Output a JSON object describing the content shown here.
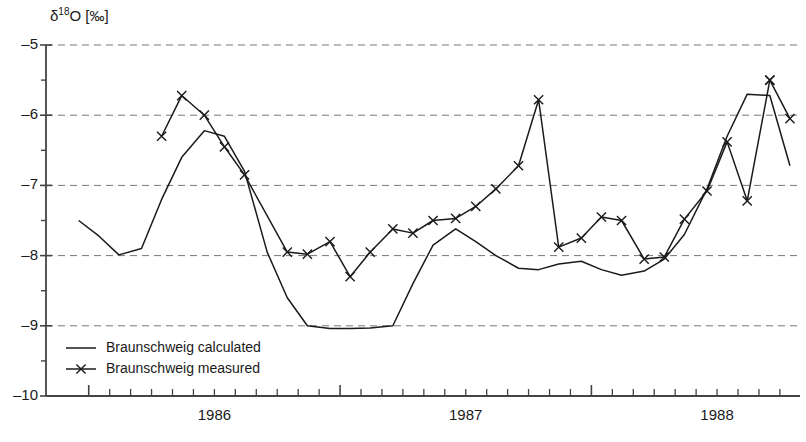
{
  "chart_data": {
    "type": "line",
    "title": "",
    "subtitle": "",
    "xlabel": "",
    "ylabel": "δ18O [‰]",
    "ylabel_parts": {
      "delta": "δ",
      "superscript": "18",
      "element": "O",
      "unit": "[‰]"
    },
    "ylim": [
      -10,
      -5
    ],
    "xlim": [
      1985.83,
      1988.83
    ],
    "ytick_labels": [
      "-5",
      "-6",
      "-7",
      "-8",
      "-9",
      "-10"
    ],
    "ytick_values": [
      -5,
      -6,
      -7,
      -8,
      -9,
      -10
    ],
    "yminor_values": [
      -5.5,
      -6.5,
      -7.5,
      -8.5,
      -9.5
    ],
    "xtick_labels": [
      "1986",
      "1987",
      "1988"
    ],
    "xtick_values": [
      1986.5,
      1987.5,
      1988.5
    ],
    "grid": "horizontal-dashed",
    "legend_position": "bottom-left",
    "series": [
      {
        "name": "Braunschweig calculated",
        "marker": "none",
        "linestyle": "solid",
        "color": "#1a1a1a",
        "x": [
          1985.96,
          1986.04,
          1986.12,
          1986.21,
          1986.29,
          1986.37,
          1986.46,
          1986.54,
          1986.62,
          1986.71,
          1986.79,
          1986.87,
          1986.96,
          1987.04,
          1987.12,
          1987.21,
          1987.29,
          1987.37,
          1987.46,
          1987.54,
          1987.62,
          1987.71,
          1987.79,
          1987.87,
          1987.96,
          1988.04,
          1988.12,
          1988.21,
          1988.29,
          1988.37,
          1988.46,
          1988.54,
          1988.62,
          1988.71,
          1988.79
        ],
        "y": [
          -7.5,
          -7.72,
          -7.99,
          -7.9,
          -7.2,
          -6.6,
          -6.22,
          -6.3,
          -6.8,
          -7.95,
          -8.6,
          -9.0,
          -9.04,
          -9.04,
          -9.03,
          -9.0,
          -8.4,
          -7.85,
          -7.62,
          -7.8,
          -8.0,
          -8.18,
          -8.2,
          -8.12,
          -8.08,
          -8.2,
          -8.28,
          -8.22,
          -8.05,
          -7.7,
          -7.05,
          -6.3,
          -5.7,
          -5.72,
          -6.72
        ]
      },
      {
        "name": "Braunschweig measured",
        "marker": "x",
        "linestyle": "solid",
        "color": "#1a1a1a",
        "x": [
          1986.29,
          1986.37,
          1986.46,
          1986.54,
          1986.62,
          1986.79,
          1986.87,
          1986.96,
          1987.04,
          1987.12,
          1987.21,
          1987.29,
          1987.37,
          1987.46,
          1987.54,
          1987.62,
          1987.71,
          1987.79,
          1987.87,
          1987.96,
          1988.04,
          1988.12,
          1988.21,
          1988.29,
          1988.37,
          1988.46,
          1988.54,
          1988.62,
          1988.71
        ],
        "y": [
          -6.3,
          -5.72,
          -6.0,
          -6.45,
          -6.85,
          -7.95,
          -7.98,
          -7.8,
          -8.3,
          -7.95,
          -7.62,
          -7.68,
          -7.5,
          -7.47,
          -7.3,
          -7.05,
          -6.72,
          -5.78,
          -7.88,
          -7.75,
          -7.45,
          -7.5,
          -8.05,
          -8.02,
          -7.48,
          -7.08,
          -6.38,
          -7.22,
          -5.5
        ]
      },
      {
        "name": "Braunschweig measured tail",
        "marker": "x",
        "linestyle": "solid",
        "color": "#1a1a1a",
        "x": [
          1988.71,
          1988.79
        ],
        "y": [
          -5.5,
          -6.05
        ]
      }
    ]
  },
  "legend": {
    "items": [
      {
        "label": "Braunschweig calculated",
        "marker": "line"
      },
      {
        "label": "Braunschweig measured",
        "marker": "line-x"
      }
    ]
  }
}
